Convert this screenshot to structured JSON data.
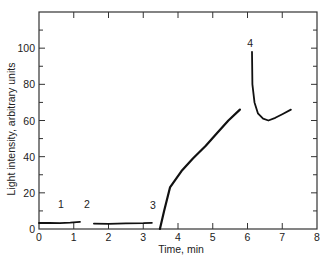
{
  "chart_data": {
    "type": "line",
    "title": "",
    "xlabel": "Time, min",
    "ylabel": "Light intensity, arbitrary units",
    "xlim": [
      0,
      8
    ],
    "ylim": [
      0,
      120
    ],
    "x_ticks": [
      0,
      1,
      2,
      3,
      4,
      5,
      6,
      7,
      8
    ],
    "x_tick_labels": [
      "0",
      "1",
      "2",
      "3",
      "4",
      "5",
      "6",
      "7",
      "8"
    ],
    "y_ticks_major": [
      0,
      20,
      40,
      60,
      80,
      100
    ],
    "y_tick_labels": [
      "0",
      "20",
      "40",
      "60",
      "80",
      "100"
    ],
    "y_ticks_minor": [
      10,
      30,
      50,
      70,
      90,
      110
    ],
    "grid": false,
    "legend": null,
    "series": [
      {
        "name": "segment-1",
        "x": [
          0,
          0.3,
          0.6,
          0.9,
          1.18
        ],
        "values": [
          3.3,
          3.4,
          3.2,
          3.5,
          4.0
        ]
      },
      {
        "name": "segment-2",
        "x": [
          1.58,
          2.0,
          2.5,
          3.0,
          3.25
        ],
        "values": [
          3.0,
          2.9,
          3.1,
          3.2,
          3.4
        ]
      },
      {
        "name": "segment-3-rise",
        "x": [
          3.48,
          3.6,
          3.77,
          4.1,
          4.43,
          4.8,
          5.12,
          5.45,
          5.78
        ],
        "values": [
          0,
          10,
          23,
          32,
          39,
          46,
          53,
          60,
          66
        ]
      },
      {
        "name": "segment-4-peak",
        "x": [
          6.13,
          6.14,
          6.2,
          6.3,
          6.45,
          6.6,
          6.8,
          7.0,
          7.25
        ],
        "values": [
          98,
          80,
          70,
          64,
          61,
          60,
          61.5,
          63.5,
          66
        ]
      }
    ],
    "annotations": [
      {
        "text": "1",
        "x": 0.63,
        "y": 14
      },
      {
        "text": "2",
        "x": 1.38,
        "y": 14
      },
      {
        "text": "3",
        "x": 3.28,
        "y": 13
      },
      {
        "text": "4",
        "x": 6.08,
        "y": 103
      }
    ]
  }
}
